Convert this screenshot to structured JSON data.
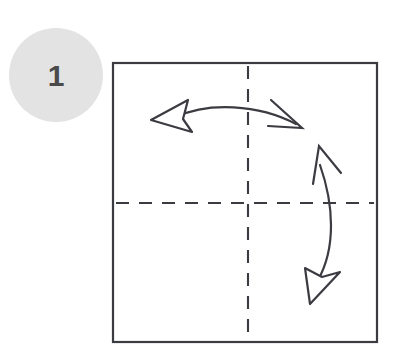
{
  "figure": {
    "type": "instructional-diagram",
    "background_color": "#ffffff",
    "width": 398,
    "height": 360
  },
  "step_badge": {
    "label": "1",
    "shape": "circle",
    "fill_color": "#e3e3e3",
    "text_color": "#4a4a4a",
    "center_x": 56,
    "center_y": 75,
    "radius": 47
  },
  "paper": {
    "name": "square-paper-sheet",
    "shape": "square",
    "stroke_color": "#3b3b42",
    "fill_color": "#ffffff",
    "left": 113,
    "top": 63,
    "width": 264,
    "height": 279
  },
  "fold_lines": [
    {
      "name": "vertical-fold-line",
      "orientation": "vertical",
      "style": "dashed",
      "color": "#3b3b42",
      "position": 248
    },
    {
      "name": "horizontal-fold-line",
      "orientation": "horizontal",
      "style": "dashed",
      "color": "#3b3b42",
      "position": 203
    }
  ],
  "arrows": [
    {
      "name": "horizontal-double-arrow",
      "meaning": "fold-and-unfold-left-right",
      "color": "#3b3b42",
      "head_start": "hollow-triangle",
      "head_end": "open-v",
      "tip_start": [
        151,
        120
      ],
      "tip_end": [
        302,
        128
      ]
    },
    {
      "name": "vertical-double-arrow",
      "meaning": "fold-and-unfold-top-bottom",
      "color": "#3b3b42",
      "head_start": "open-v",
      "head_end": "hollow-triangle",
      "tip_start": [
        319,
        146
      ],
      "tip_end": [
        310,
        304
      ]
    }
  ],
  "colors": {
    "ink": "#3b3b42",
    "badge_fill": "#e3e3e3",
    "badge_text": "#4a4a4a",
    "paper_fill": "#ffffff"
  }
}
